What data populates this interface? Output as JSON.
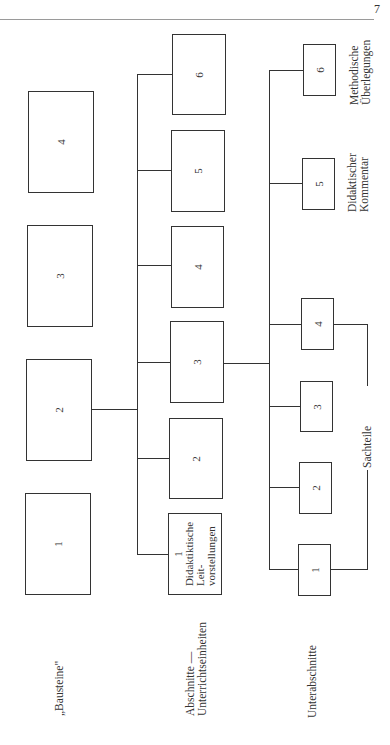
{
  "page": {
    "number": "7"
  },
  "rows": {
    "bausteine": {
      "label": "„Bausteine\"",
      "boxes": [
        "1",
        "2",
        "3",
        "4"
      ]
    },
    "abschnitte": {
      "label_line1": "Abschnitte —",
      "label_line2": "Unterrichtseinheiten",
      "boxes": [
        "1",
        "2",
        "3",
        "4",
        "5",
        "6"
      ],
      "box1_lines": [
        "1",
        "Didaktiktische",
        "Leit-",
        "vorstellungen"
      ]
    },
    "unterabschnitte": {
      "label": "Unterabschnitte",
      "boxes": [
        "1",
        "2",
        "3",
        "4",
        "5",
        "6"
      ]
    }
  },
  "annotations": {
    "sachteile": "Sachteile",
    "didaktischer_line1": "Didaktischer",
    "didaktischer_line2": "Kommentar",
    "methodische_line1": "Methodische",
    "methodische_line2": "Überlegungen"
  }
}
